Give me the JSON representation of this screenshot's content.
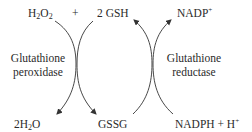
{
  "diagram": {
    "type": "coupled-reaction-cycle",
    "left_reaction": {
      "enzyme": [
        "Glutathione",
        "peroxidase"
      ],
      "substrates": [
        {
          "text": "H",
          "sub1": "2",
          "text2": "O",
          "sub2": "2"
        },
        {
          "text": "2 GSH"
        }
      ],
      "plus": "+",
      "products": [
        {
          "text": "2H",
          "sub": "2",
          "text2": "O"
        },
        {
          "text": "GSSG"
        }
      ]
    },
    "right_reaction": {
      "enzyme": [
        "Glutathione",
        "reductase"
      ],
      "substrates": [
        {
          "text": "GSSG"
        },
        {
          "text": "NADPH + H",
          "sup": "+"
        }
      ],
      "products": [
        {
          "text": "2 GSH"
        },
        {
          "text": "NADP",
          "sup": "+"
        }
      ]
    },
    "colors": {
      "text": "#2a2a2a",
      "arrows": "#333333",
      "background": "#ffffff"
    }
  }
}
